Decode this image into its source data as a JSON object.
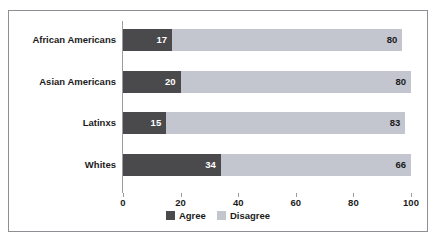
{
  "chart_data": {
    "type": "bar",
    "orientation": "horizontal",
    "stacked": true,
    "title": "",
    "xlabel": "",
    "ylabel": "",
    "xlim": [
      0,
      100
    ],
    "xticks": [
      0,
      20,
      40,
      60,
      80,
      100
    ],
    "xtick_labels": [
      "0",
      "20",
      "40",
      "60",
      "80",
      "100"
    ],
    "grid": false,
    "legend_position": "bottom-center",
    "categories": [
      "African Americans",
      "Asian Americans",
      "Latinxs",
      "Whites"
    ],
    "series": [
      {
        "name": "Agree",
        "color": "#4a4a4d",
        "values": [
          17,
          20,
          15,
          34
        ]
      },
      {
        "name": "Disagree",
        "color": "#c3c6cf",
        "values": [
          80,
          80,
          83,
          66
        ]
      }
    ]
  },
  "legend": {
    "items": [
      {
        "label": "Agree",
        "swatch": "agree"
      },
      {
        "label": "Disagree",
        "swatch": "disagree"
      }
    ]
  },
  "colors": {
    "agree": "#4a4a4d",
    "disagree": "#c3c6cf",
    "border": "#8d8f94",
    "axis": "#9a9ca1",
    "text": "#1b1b1b",
    "background": "#ffffff"
  }
}
